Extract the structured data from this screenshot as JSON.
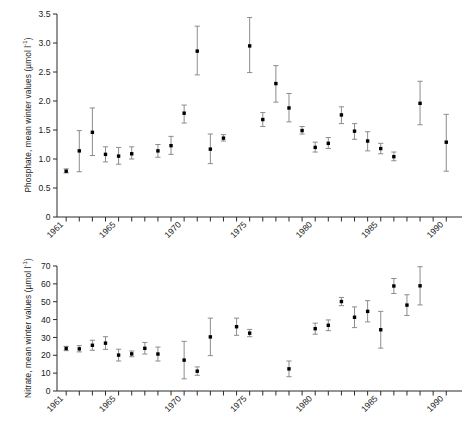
{
  "figure": {
    "background": "#ffffff",
    "marker_color": "#000000",
    "errorbar_color": "#8c8c8c",
    "axis_color": "#2b2b2b"
  },
  "chart_data": [
    {
      "type": "scatter",
      "id": "phosphate",
      "title": "",
      "xlabel": "",
      "ylabel": "Phosphate, mean winter values (µmol l⁻¹)",
      "ylabel_parts": {
        "text": "Phosphate, mean winter values (µmol l",
        "sup": "-1",
        "tail": ")"
      },
      "xlim": [
        1960.3,
        1991.2
      ],
      "ylim": [
        0,
        3.5
      ],
      "yticks": [
        0,
        0.5,
        1.0,
        1.5,
        2.0,
        2.5,
        3.0,
        3.5
      ],
      "yticklabels": [
        "0",
        "0.5",
        "1.0",
        "1.5",
        "2.0",
        "2.5",
        "3.0",
        "3.5"
      ],
      "xticks": [
        1961,
        1962,
        1963,
        1964,
        1965,
        1966,
        1967,
        1968,
        1969,
        1970,
        1971,
        1972,
        1973,
        1974,
        1975,
        1976,
        1977,
        1978,
        1979,
        1980,
        1981,
        1982,
        1983,
        1984,
        1985,
        1986,
        1987,
        1988,
        1989,
        1990
      ],
      "xticklabels_shown": [
        "1961",
        "1965",
        "1970",
        "1975",
        "1980",
        "1985",
        "1990"
      ],
      "xticklabel_years": [
        1961,
        1965,
        1970,
        1975,
        1980,
        1985,
        1990
      ],
      "grid": false,
      "legend": "none",
      "errorbars": "vertical, symmetric-ish, with caps",
      "x": [
        1961,
        1962,
        1963,
        1964,
        1965,
        1966,
        1967,
        1969,
        1970,
        1971,
        1972,
        1973,
        1974,
        1975,
        1976,
        1977,
        1978,
        1979,
        1980,
        1981,
        1982,
        1983,
        1984,
        1985,
        1986,
        1987,
        1989,
        1990
      ],
      "y": [
        0.79,
        1.14,
        1.46,
        1.08,
        1.05,
        1.09,
        1.14,
        1.23,
        1.79,
        2.86,
        1.17,
        1.36,
        2.95,
        1.68,
        2.3,
        1.88,
        1.49,
        1.2,
        1.27,
        1.76,
        1.48,
        1.31,
        1.18,
        1.04,
        1.96,
        1.29,
        1.96,
        1.29
      ],
      "values": [
        {
          "year": 1961,
          "value": 0.79,
          "low": 0.76,
          "high": 0.83
        },
        {
          "year": 1962,
          "value": 1.14,
          "low": 0.78,
          "high": 1.49
        },
        {
          "year": 1963,
          "value": 1.46,
          "low": 1.06,
          "high": 1.88
        },
        {
          "year": 1964,
          "value": 1.08,
          "low": 0.95,
          "high": 1.21
        },
        {
          "year": 1965,
          "value": 1.05,
          "low": 0.91,
          "high": 1.2
        },
        {
          "year": 1966,
          "value": 1.09,
          "low": 1.0,
          "high": 1.21
        },
        {
          "year": 1968,
          "value": 1.14,
          "low": 1.03,
          "high": 1.25
        },
        {
          "year": 1969,
          "value": 1.23,
          "low": 1.08,
          "high": 1.39
        },
        {
          "year": 1970,
          "value": 1.79,
          "low": 1.62,
          "high": 1.93
        },
        {
          "year": 1971,
          "value": 2.86,
          "low": 2.45,
          "high": 3.29
        },
        {
          "year": 1972,
          "value": 1.17,
          "low": 0.92,
          "high": 1.43
        },
        {
          "year": 1973,
          "value": 1.36,
          "low": 1.31,
          "high": 1.42
        },
        {
          "year": 1975,
          "value": 2.95,
          "low": 2.49,
          "high": 3.44
        },
        {
          "year": 1976,
          "value": 1.68,
          "low": 1.56,
          "high": 1.8
        },
        {
          "year": 1977,
          "value": 2.3,
          "low": 1.98,
          "high": 2.61
        },
        {
          "year": 1978,
          "value": 1.88,
          "low": 1.64,
          "high": 2.13
        },
        {
          "year": 1979,
          "value": 1.49,
          "low": 1.43,
          "high": 1.56
        },
        {
          "year": 1980,
          "value": 1.2,
          "low": 1.12,
          "high": 1.29
        },
        {
          "year": 1981,
          "value": 1.27,
          "low": 1.18,
          "high": 1.37
        },
        {
          "year": 1982,
          "value": 1.76,
          "low": 1.61,
          "high": 1.9
        },
        {
          "year": 1983,
          "value": 1.48,
          "low": 1.34,
          "high": 1.61
        },
        {
          "year": 1984,
          "value": 1.31,
          "low": 1.14,
          "high": 1.47
        },
        {
          "year": 1985,
          "value": 1.18,
          "low": 1.09,
          "high": 1.27
        },
        {
          "year": 1986,
          "value": 1.04,
          "low": 0.97,
          "high": 1.12
        },
        {
          "year": 1988,
          "value": 1.96,
          "low": 1.59,
          "high": 2.34
        },
        {
          "year": 1990,
          "value": 1.29,
          "low": 0.79,
          "high": 1.77
        }
      ]
    },
    {
      "type": "scatter",
      "id": "nitrate",
      "title": "",
      "xlabel": "",
      "ylabel": "Nitrate, mean winter values (µmol l⁻¹)",
      "ylabel_parts": {
        "text": "Nitrate, mean winter values (µmol l",
        "sup": "-1",
        "tail": ")"
      },
      "xlim": [
        1960.3,
        1991.2
      ],
      "ylim": [
        0,
        70
      ],
      "yticks": [
        0,
        10,
        20,
        30,
        40,
        50,
        60,
        70
      ],
      "yticklabels": [
        "0",
        "10",
        "20",
        "30",
        "40",
        "50",
        "60",
        "70"
      ],
      "xticks": [
        1961,
        1962,
        1963,
        1964,
        1965,
        1966,
        1967,
        1968,
        1969,
        1970,
        1971,
        1972,
        1973,
        1974,
        1975,
        1976,
        1977,
        1978,
        1979,
        1980,
        1981,
        1982,
        1983,
        1984,
        1985,
        1986,
        1987,
        1988,
        1989,
        1990
      ],
      "xticklabels_shown": [
        "1961",
        "1965",
        "1970",
        "1975",
        "1980",
        "1985",
        "1990"
      ],
      "xticklabel_years": [
        1961,
        1965,
        1970,
        1975,
        1980,
        1985,
        1990
      ],
      "grid": false,
      "legend": "none",
      "errorbars": "vertical, symmetric-ish, with caps",
      "x": [
        1961,
        1962,
        1963,
        1964,
        1965,
        1966,
        1967,
        1968,
        1970,
        1971,
        1972,
        1974,
        1975,
        1978,
        1980,
        1981,
        1982,
        1983,
        1984,
        1985,
        1986,
        1987,
        1988
      ],
      "y": [
        23.8,
        23.6,
        25.6,
        26.8,
        20.1,
        20.8,
        23.9,
        20.7,
        17.3,
        11.1,
        30.3,
        36.0,
        32.4,
        12.4,
        34.9,
        36.8,
        50.1,
        41.3,
        44.6,
        34.3,
        58.8,
        48.1,
        58.9
      ],
      "values": [
        {
          "year": 1961,
          "value": 23.8,
          "low": 22.6,
          "high": 25.0
        },
        {
          "year": 1962,
          "value": 23.6,
          "low": 21.9,
          "high": 25.4
        },
        {
          "year": 1963,
          "value": 25.6,
          "low": 22.8,
          "high": 28.4
        },
        {
          "year": 1964,
          "value": 26.8,
          "low": 23.3,
          "high": 30.4
        },
        {
          "year": 1965,
          "value": 20.1,
          "low": 16.8,
          "high": 23.4
        },
        {
          "year": 1966,
          "value": 20.8,
          "low": 19.2,
          "high": 22.4
        },
        {
          "year": 1967,
          "value": 23.9,
          "low": 20.7,
          "high": 27.2
        },
        {
          "year": 1968,
          "value": 20.7,
          "low": 16.8,
          "high": 24.6
        },
        {
          "year": 1970,
          "value": 17.3,
          "low": 6.8,
          "high": 27.8
        },
        {
          "year": 1971,
          "value": 11.1,
          "low": 8.8,
          "high": 13.5
        },
        {
          "year": 1972,
          "value": 30.3,
          "low": 19.8,
          "high": 40.8
        },
        {
          "year": 1974,
          "value": 36.0,
          "low": 31.2,
          "high": 40.8
        },
        {
          "year": 1975,
          "value": 32.4,
          "low": 30.4,
          "high": 34.5
        },
        {
          "year": 1978,
          "value": 12.4,
          "low": 8.0,
          "high": 16.8
        },
        {
          "year": 1980,
          "value": 34.9,
          "low": 31.8,
          "high": 38.0
        },
        {
          "year": 1981,
          "value": 36.8,
          "low": 33.8,
          "high": 39.8
        },
        {
          "year": 1982,
          "value": 50.1,
          "low": 47.8,
          "high": 52.4
        },
        {
          "year": 1983,
          "value": 41.3,
          "low": 35.5,
          "high": 47.1
        },
        {
          "year": 1984,
          "value": 44.6,
          "low": 38.7,
          "high": 50.6
        },
        {
          "year": 1985,
          "value": 34.3,
          "low": 24.0,
          "high": 44.6
        },
        {
          "year": 1986,
          "value": 58.8,
          "low": 54.6,
          "high": 63.0
        },
        {
          "year": 1987,
          "value": 48.1,
          "low": 42.3,
          "high": 53.9
        },
        {
          "year": 1988,
          "value": 58.9,
          "low": 48.2,
          "high": 69.6
        }
      ]
    }
  ]
}
